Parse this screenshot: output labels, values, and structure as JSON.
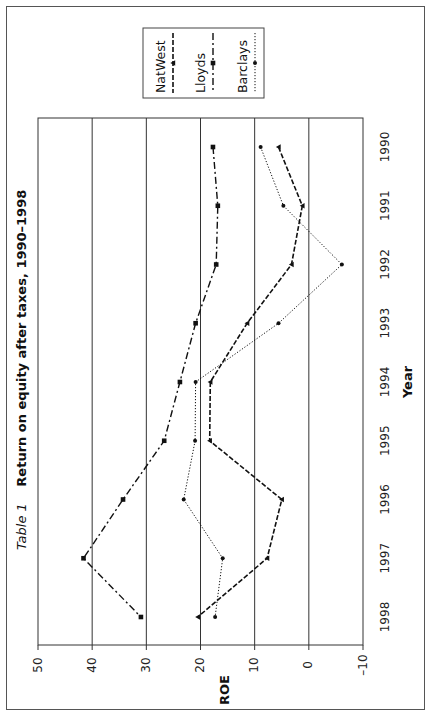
{
  "chart_data": {
    "type": "line",
    "orientation": "rotated-90-clockwise",
    "title_prefix": "Table 1",
    "title": "Return on equity after taxes, 1990–1998",
    "xlabel": "Year",
    "ylabel": "ROE",
    "categories": [
      "1990",
      "1991",
      "1992",
      "1993",
      "1994",
      "1995",
      "1996",
      "1997",
      "1998"
    ],
    "ylim": [
      -10,
      50
    ],
    "yticks": [
      "50",
      "40",
      "30",
      "20",
      "10",
      "0",
      "–10"
    ],
    "ytick_values": [
      50,
      40,
      30,
      20,
      10,
      0,
      -10
    ],
    "grid": true,
    "legend_position": "top-right",
    "series": [
      {
        "name": "NatWest",
        "style": "dashed",
        "marker": "triangle",
        "values": [
          5.6,
          1.2,
          3.2,
          11.4,
          18.2,
          18.3,
          5.0,
          7.7,
          20.5
        ]
      },
      {
        "name": "Lloyds",
        "style": "dash-dot",
        "marker": "square",
        "values": [
          17.7,
          16.8,
          17.1,
          20.9,
          23.8,
          26.7,
          34.3,
          41.6,
          31.0
        ]
      },
      {
        "name": "Barclays",
        "style": "dotted",
        "marker": "circle",
        "values": [
          8.9,
          4.7,
          -6.1,
          5.6,
          20.9,
          21.0,
          23.1,
          15.9,
          17.3
        ]
      }
    ]
  },
  "legend": {
    "items": [
      {
        "label": "NatWest"
      },
      {
        "label": "Lloyds"
      },
      {
        "label": "Barclays"
      }
    ]
  }
}
